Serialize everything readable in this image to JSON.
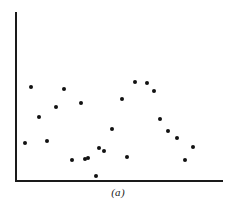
{
  "figure": {
    "caption": "(a)",
    "caption_x": 118,
    "caption_y": 186,
    "background_color": "#ffffff",
    "ink_color": "#111111"
  },
  "axes": {
    "y_axis": {
      "name": "y-axis",
      "x": 15,
      "y_top": 12,
      "y_bottom": 181,
      "color": "#1a1a1a",
      "width": 2
    },
    "x_axis": {
      "name": "x-axis",
      "y": 180,
      "x_left": 15,
      "x_right": 223,
      "color": "#1a1a1a",
      "width": 2
    }
  },
  "chart_data": {
    "type": "scatter",
    "title": "(a)",
    "xlabel": "",
    "ylabel": "",
    "grid": false,
    "legend": null,
    "axis_ticks": {
      "x": [],
      "y": []
    },
    "xlim": [
      15,
      223
    ],
    "ylim": [
      12,
      180
    ],
    "note": "Unlabeled scatter plot; axes drawn without tick marks or numeric scale. Values below are pixel coordinates of each plotted marker within the figure.",
    "marker": {
      "shape": "circle",
      "filled": true,
      "color": "#111111",
      "size_px": 4
    },
    "n_points": 24,
    "points_px": [
      {
        "x": 31,
        "y": 87
      },
      {
        "x": 64,
        "y": 89
      },
      {
        "x": 56,
        "y": 107
      },
      {
        "x": 81,
        "y": 103
      },
      {
        "x": 39,
        "y": 117
      },
      {
        "x": 122,
        "y": 99
      },
      {
        "x": 135,
        "y": 82
      },
      {
        "x": 147,
        "y": 83
      },
      {
        "x": 154,
        "y": 91
      },
      {
        "x": 25,
        "y": 143
      },
      {
        "x": 47,
        "y": 141
      },
      {
        "x": 112,
        "y": 129
      },
      {
        "x": 160,
        "y": 119
      },
      {
        "x": 168,
        "y": 131
      },
      {
        "x": 177,
        "y": 138
      },
      {
        "x": 104,
        "y": 151
      },
      {
        "x": 193,
        "y": 147
      },
      {
        "x": 72,
        "y": 160
      },
      {
        "x": 85,
        "y": 159
      },
      {
        "x": 88,
        "y": 158
      },
      {
        "x": 127,
        "y": 157
      },
      {
        "x": 185,
        "y": 160
      },
      {
        "x": 96,
        "y": 176
      },
      {
        "x": 99,
        "y": 148
      }
    ],
    "x": [
      31,
      64,
      56,
      81,
      39,
      122,
      135,
      147,
      154,
      25,
      47,
      112,
      160,
      168,
      177,
      104,
      193,
      72,
      85,
      88,
      127,
      185,
      96,
      99
    ],
    "y_inverted_px": [
      87,
      89,
      107,
      103,
      117,
      99,
      82,
      83,
      91,
      143,
      141,
      129,
      119,
      131,
      138,
      151,
      147,
      160,
      159,
      158,
      157,
      160,
      176,
      148
    ]
  }
}
